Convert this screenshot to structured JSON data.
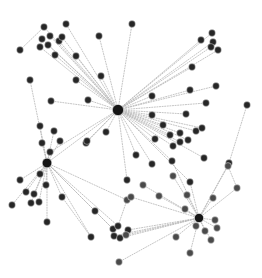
{
  "figure": {
    "type": "node-link-diagram",
    "width": 262,
    "height": 278,
    "background_color": "#ffffff",
    "node_color": "#262626",
    "hub_color": "#151515",
    "secondary_node_color": "#4a4a4a",
    "edge_color": "#b9b9b9",
    "edge_style": "dotted",
    "node_count": 91,
    "edge_count": 96,
    "hub_count": 3
  },
  "graph_data": {
    "type": "graph",
    "layout": "force-directed",
    "directed": false,
    "nodes": [
      {
        "id": "h1",
        "x": 118,
        "y": 110,
        "r": 5.6,
        "kind": "hub"
      },
      {
        "id": "h2",
        "x": 47,
        "y": 163,
        "r": 4.8,
        "kind": "hub"
      },
      {
        "id": "h3",
        "x": 199,
        "y": 218,
        "r": 4.6,
        "kind": "hub"
      },
      {
        "id": "n1",
        "x": 66,
        "y": 24,
        "r": 3.4,
        "kind": "normal"
      },
      {
        "id": "n2",
        "x": 44,
        "y": 27,
        "r": 3.4,
        "kind": "normal"
      },
      {
        "id": "n3",
        "x": 42,
        "y": 39,
        "r": 3.4,
        "kind": "normal"
      },
      {
        "id": "n4",
        "x": 50,
        "y": 36,
        "r": 3.4,
        "kind": "normal"
      },
      {
        "id": "n5",
        "x": 48,
        "y": 45,
        "r": 3.4,
        "kind": "normal"
      },
      {
        "id": "n6",
        "x": 40,
        "y": 47,
        "r": 3.4,
        "kind": "normal"
      },
      {
        "id": "n7",
        "x": 59,
        "y": 41,
        "r": 3.4,
        "kind": "normal"
      },
      {
        "id": "n8",
        "x": 55,
        "y": 55,
        "r": 3.4,
        "kind": "normal"
      },
      {
        "id": "n9",
        "x": 20,
        "y": 50,
        "r": 3.4,
        "kind": "normal"
      },
      {
        "id": "n10",
        "x": 76,
        "y": 56,
        "r": 3.4,
        "kind": "normal"
      },
      {
        "id": "n11",
        "x": 101,
        "y": 76,
        "r": 3.4,
        "kind": "normal"
      },
      {
        "id": "n12",
        "x": 132,
        "y": 24,
        "r": 3.4,
        "kind": "normal"
      },
      {
        "id": "n13",
        "x": 30,
        "y": 80,
        "r": 3.4,
        "kind": "normal"
      },
      {
        "id": "n14",
        "x": 51,
        "y": 101,
        "r": 3.4,
        "kind": "normal"
      },
      {
        "id": "n15",
        "x": 40,
        "y": 126,
        "r": 3.4,
        "kind": "normal"
      },
      {
        "id": "n16",
        "x": 50,
        "y": 152,
        "r": 3.4,
        "kind": "normal"
      },
      {
        "id": "n17",
        "x": 201,
        "y": 40,
        "r": 3.4,
        "kind": "normal"
      },
      {
        "id": "n18",
        "x": 212,
        "y": 33,
        "r": 3.4,
        "kind": "normal"
      },
      {
        "id": "n19",
        "x": 213,
        "y": 42,
        "r": 3.4,
        "kind": "normal"
      },
      {
        "id": "n20",
        "x": 211,
        "y": 47,
        "r": 3.4,
        "kind": "normal"
      },
      {
        "id": "n21",
        "x": 218,
        "y": 50,
        "r": 3.4,
        "kind": "normal"
      },
      {
        "id": "n22",
        "x": 192,
        "y": 67,
        "r": 3.4,
        "kind": "normal"
      },
      {
        "id": "n23",
        "x": 190,
        "y": 90,
        "r": 3.4,
        "kind": "normal"
      },
      {
        "id": "n24",
        "x": 216,
        "y": 86,
        "r": 3.4,
        "kind": "normal"
      },
      {
        "id": "n25",
        "x": 152,
        "y": 96,
        "r": 3.4,
        "kind": "normal"
      },
      {
        "id": "n26",
        "x": 152,
        "y": 115,
        "r": 3.4,
        "kind": "normal"
      },
      {
        "id": "n27",
        "x": 186,
        "y": 114,
        "r": 3.4,
        "kind": "normal"
      },
      {
        "id": "n28",
        "x": 170,
        "y": 135,
        "r": 3.4,
        "kind": "normal"
      },
      {
        "id": "n29",
        "x": 180,
        "y": 133,
        "r": 3.4,
        "kind": "normal"
      },
      {
        "id": "n30",
        "x": 196,
        "y": 131,
        "r": 3.4,
        "kind": "normal"
      },
      {
        "id": "n31",
        "x": 173,
        "y": 146,
        "r": 3.4,
        "kind": "normal"
      },
      {
        "id": "n32",
        "x": 180,
        "y": 142,
        "r": 3.4,
        "kind": "normal"
      },
      {
        "id": "n33",
        "x": 188,
        "y": 140,
        "r": 3.4,
        "kind": "normal"
      },
      {
        "id": "n34",
        "x": 202,
        "y": 128,
        "r": 3.4,
        "kind": "normal"
      },
      {
        "id": "n35",
        "x": 172,
        "y": 161,
        "r": 3.4,
        "kind": "normal"
      },
      {
        "id": "n36",
        "x": 190,
        "y": 182,
        "r": 3.4,
        "kind": "normal"
      },
      {
        "id": "n37",
        "x": 204,
        "y": 158,
        "r": 3.4,
        "kind": "normal"
      },
      {
        "id": "n38",
        "x": 136,
        "y": 155,
        "r": 3.4,
        "kind": "normal"
      },
      {
        "id": "n39",
        "x": 152,
        "y": 164,
        "r": 3.4,
        "kind": "normal"
      },
      {
        "id": "n40",
        "x": 127,
        "y": 180,
        "r": 3.4,
        "kind": "normal"
      },
      {
        "id": "n41",
        "x": 247,
        "y": 105,
        "r": 3.4,
        "kind": "normal"
      },
      {
        "id": "n42",
        "x": 229,
        "y": 163,
        "r": 3.4,
        "kind": "normal"
      },
      {
        "id": "n43",
        "x": 86,
        "y": 143,
        "r": 3.4,
        "kind": "normal"
      },
      {
        "id": "n44",
        "x": 20,
        "y": 180,
        "r": 3.4,
        "kind": "normal"
      },
      {
        "id": "n45",
        "x": 40,
        "y": 174,
        "r": 3.4,
        "kind": "normal"
      },
      {
        "id": "n46",
        "x": 26,
        "y": 192,
        "r": 3.4,
        "kind": "normal"
      },
      {
        "id": "n47",
        "x": 34,
        "y": 194,
        "r": 3.4,
        "kind": "normal"
      },
      {
        "id": "n48",
        "x": 31,
        "y": 203,
        "r": 3.4,
        "kind": "normal"
      },
      {
        "id": "n49",
        "x": 39,
        "y": 202,
        "r": 3.4,
        "kind": "normal"
      },
      {
        "id": "n50",
        "x": 12,
        "y": 205,
        "r": 3.4,
        "kind": "normal"
      },
      {
        "id": "n51",
        "x": 46,
        "y": 185,
        "r": 3.4,
        "kind": "normal"
      },
      {
        "id": "n52",
        "x": 62,
        "y": 197,
        "r": 3.4,
        "kind": "normal"
      },
      {
        "id": "n53",
        "x": 47,
        "y": 222,
        "r": 3.4,
        "kind": "normal"
      },
      {
        "id": "n54",
        "x": 95,
        "y": 211,
        "r": 3.4,
        "kind": "normal"
      },
      {
        "id": "n55",
        "x": 91,
        "y": 237,
        "r": 3.4,
        "kind": "normal"
      },
      {
        "id": "n56",
        "x": 113,
        "y": 229,
        "r": 3.4,
        "kind": "normal"
      },
      {
        "id": "n57",
        "x": 118,
        "y": 226,
        "r": 3.4,
        "kind": "normal"
      },
      {
        "id": "n58",
        "x": 114,
        "y": 236,
        "r": 3.4,
        "kind": "normal"
      },
      {
        "id": "n59",
        "x": 120,
        "y": 238,
        "r": 3.4,
        "kind": "normal"
      },
      {
        "id": "n60",
        "x": 128,
        "y": 230,
        "r": 3.4,
        "kind": "normal"
      },
      {
        "id": "n61",
        "x": 126,
        "y": 235,
        "r": 3.4,
        "kind": "light"
      },
      {
        "id": "n62",
        "x": 127,
        "y": 200,
        "r": 3.4,
        "kind": "light"
      },
      {
        "id": "n63",
        "x": 119,
        "y": 262,
        "r": 3.4,
        "kind": "light"
      },
      {
        "id": "n64",
        "x": 176,
        "y": 237,
        "r": 3.4,
        "kind": "light"
      },
      {
        "id": "n65",
        "x": 185,
        "y": 209,
        "r": 3.4,
        "kind": "light"
      },
      {
        "id": "n66",
        "x": 196,
        "y": 226,
        "r": 3.4,
        "kind": "light"
      },
      {
        "id": "n67",
        "x": 205,
        "y": 231,
        "r": 3.4,
        "kind": "light"
      },
      {
        "id": "n68",
        "x": 215,
        "y": 220,
        "r": 3.4,
        "kind": "light"
      },
      {
        "id": "n69",
        "x": 217,
        "y": 228,
        "r": 3.4,
        "kind": "light"
      },
      {
        "id": "n70",
        "x": 211,
        "y": 240,
        "r": 3.4,
        "kind": "light"
      },
      {
        "id": "n71",
        "x": 190,
        "y": 253,
        "r": 3.4,
        "kind": "light"
      },
      {
        "id": "n72",
        "x": 213,
        "y": 198,
        "r": 3.4,
        "kind": "light"
      },
      {
        "id": "n73",
        "x": 228,
        "y": 166,
        "r": 3.4,
        "kind": "light"
      },
      {
        "id": "n74",
        "x": 187,
        "y": 195,
        "r": 3.4,
        "kind": "light"
      },
      {
        "id": "n75",
        "x": 173,
        "y": 176,
        "r": 3.4,
        "kind": "light"
      },
      {
        "id": "n76",
        "x": 155,
        "y": 139,
        "r": 3.4,
        "kind": "normal"
      },
      {
        "id": "n77",
        "x": 163,
        "y": 125,
        "r": 3.4,
        "kind": "normal"
      },
      {
        "id": "n78",
        "x": 143,
        "y": 185,
        "r": 3.4,
        "kind": "light"
      },
      {
        "id": "n79",
        "x": 131,
        "y": 197,
        "r": 3.4,
        "kind": "light"
      },
      {
        "id": "n80",
        "x": 106,
        "y": 132,
        "r": 3.4,
        "kind": "normal"
      },
      {
        "id": "n81",
        "x": 87,
        "y": 141,
        "r": 3.4,
        "kind": "normal"
      },
      {
        "id": "n82",
        "x": 60,
        "y": 141,
        "r": 3.4,
        "kind": "normal"
      },
      {
        "id": "n83",
        "x": 42,
        "y": 143,
        "r": 3.4,
        "kind": "normal"
      },
      {
        "id": "n84",
        "x": 54,
        "y": 131,
        "r": 3.4,
        "kind": "normal"
      },
      {
        "id": "n85",
        "x": 99,
        "y": 36,
        "r": 3.4,
        "kind": "normal"
      },
      {
        "id": "n86",
        "x": 76,
        "y": 80,
        "r": 3.4,
        "kind": "normal"
      },
      {
        "id": "n87",
        "x": 88,
        "y": 100,
        "r": 3.4,
        "kind": "normal"
      },
      {
        "id": "n88",
        "x": 62,
        "y": 37,
        "r": 3.4,
        "kind": "normal"
      },
      {
        "id": "n89",
        "x": 206,
        "y": 103,
        "r": 3.4,
        "kind": "normal"
      },
      {
        "id": "n90",
        "x": 237,
        "y": 188,
        "r": 3.4,
        "kind": "light"
      },
      {
        "id": "n91",
        "x": 159,
        "y": 196,
        "r": 3.4,
        "kind": "light"
      }
    ],
    "edges": [
      [
        "h1",
        "n1"
      ],
      [
        "h1",
        "n2"
      ],
      [
        "h1",
        "n3"
      ],
      [
        "h1",
        "n4"
      ],
      [
        "h1",
        "n5"
      ],
      [
        "h1",
        "n6"
      ],
      [
        "h1",
        "n7"
      ],
      [
        "h1",
        "n8"
      ],
      [
        "h1",
        "n10"
      ],
      [
        "h1",
        "n11"
      ],
      [
        "h1",
        "n12"
      ],
      [
        "h1",
        "n85"
      ],
      [
        "h1",
        "n86"
      ],
      [
        "h1",
        "n87"
      ],
      [
        "h1",
        "n88"
      ],
      [
        "h1",
        "n17"
      ],
      [
        "h1",
        "n18"
      ],
      [
        "h1",
        "n19"
      ],
      [
        "h1",
        "n20"
      ],
      [
        "h1",
        "n21"
      ],
      [
        "h1",
        "n22"
      ],
      [
        "h1",
        "n23"
      ],
      [
        "h1",
        "n24"
      ],
      [
        "h1",
        "n25"
      ],
      [
        "h1",
        "n26"
      ],
      [
        "h1",
        "n27"
      ],
      [
        "h1",
        "n89"
      ],
      [
        "h1",
        "n28"
      ],
      [
        "h1",
        "n29"
      ],
      [
        "h1",
        "n30"
      ],
      [
        "h1",
        "n31"
      ],
      [
        "h1",
        "n32"
      ],
      [
        "h1",
        "n33"
      ],
      [
        "h1",
        "n34"
      ],
      [
        "h1",
        "n35"
      ],
      [
        "h1",
        "n76"
      ],
      [
        "h1",
        "n77"
      ],
      [
        "h1",
        "n38"
      ],
      [
        "h1",
        "n39"
      ],
      [
        "h1",
        "n40"
      ],
      [
        "h1",
        "n80"
      ],
      [
        "h1",
        "n81"
      ],
      [
        "h1",
        "n43"
      ],
      [
        "h1",
        "n14"
      ],
      [
        "h1",
        "n16"
      ],
      [
        "h1",
        "h2"
      ],
      [
        "h1",
        "n36"
      ],
      [
        "h1",
        "n37"
      ],
      [
        "h2",
        "n13"
      ],
      [
        "h2",
        "n15"
      ],
      [
        "h2",
        "n16"
      ],
      [
        "h2",
        "n82"
      ],
      [
        "h2",
        "n83"
      ],
      [
        "h2",
        "n84"
      ],
      [
        "h2",
        "n44"
      ],
      [
        "h2",
        "n45"
      ],
      [
        "h2",
        "n46"
      ],
      [
        "h2",
        "n47"
      ],
      [
        "h2",
        "n48"
      ],
      [
        "h2",
        "n49"
      ],
      [
        "h2",
        "n50"
      ],
      [
        "h2",
        "n51"
      ],
      [
        "h2",
        "n52"
      ],
      [
        "h2",
        "n53"
      ],
      [
        "h2",
        "n54"
      ],
      [
        "h2",
        "n55"
      ],
      [
        "h2",
        "n56"
      ],
      [
        "h2",
        "n57"
      ],
      [
        "h2",
        "n62"
      ],
      [
        "h3",
        "n64"
      ],
      [
        "h3",
        "n65"
      ],
      [
        "h3",
        "n66"
      ],
      [
        "h3",
        "n67"
      ],
      [
        "h3",
        "n68"
      ],
      [
        "h3",
        "n69"
      ],
      [
        "h3",
        "n70"
      ],
      [
        "h3",
        "n71"
      ],
      [
        "h3",
        "n72"
      ],
      [
        "h3",
        "n73"
      ],
      [
        "h3",
        "n74"
      ],
      [
        "h3",
        "n75"
      ],
      [
        "h3",
        "n36"
      ],
      [
        "h3",
        "n35"
      ],
      [
        "h3",
        "n91"
      ],
      [
        "h3",
        "n78"
      ],
      [
        "h3",
        "n79"
      ],
      [
        "h3",
        "n58"
      ],
      [
        "h3",
        "n59"
      ],
      [
        "h3",
        "n60"
      ],
      [
        "h3",
        "n61"
      ],
      [
        "h3",
        "n63"
      ],
      [
        "h3",
        "n90"
      ],
      [
        "h3",
        "n42"
      ],
      [
        "n9",
        "n2"
      ],
      [
        "n41",
        "n42"
      ],
      [
        "n73",
        "n90"
      ],
      [
        "n54",
        "n56"
      ],
      [
        "n52",
        "n55"
      ],
      [
        "n62",
        "n57"
      ],
      [
        "n30",
        "n34"
      ]
    ]
  }
}
